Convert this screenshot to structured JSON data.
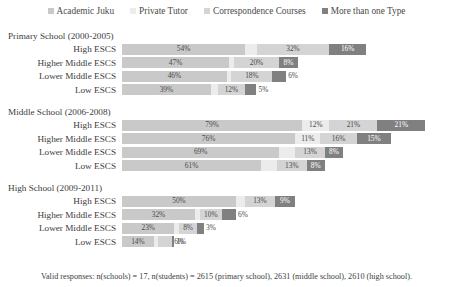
{
  "legend": {
    "items": [
      {
        "label": "Academic Juku",
        "color": "#c9c9c9",
        "icon": "square-marker-icon"
      },
      {
        "label": "Private Tutor",
        "color": "#ececec",
        "icon": "square-marker-icon"
      },
      {
        "label": "Correspondence Courses",
        "color": "#d4d4d4",
        "icon": "square-marker-icon"
      },
      {
        "label": "More than one Type",
        "color": "#808080",
        "icon": "square-marker-icon"
      }
    ]
  },
  "footnote": "Valid responses: n(schools) = 17, n(students) = 2615 (primary school), 2631 (middle school), 2610 (high school).",
  "chart_data": {
    "type": "bar",
    "orientation": "horizontal",
    "stacked": true,
    "title": "",
    "xlabel": "",
    "ylabel": "",
    "xlim": [
      0,
      100
    ],
    "grid": false,
    "legend_position": "top",
    "series": [
      {
        "name": "Academic Juku",
        "color": "#c9c9c9"
      },
      {
        "name": "Private Tutor",
        "color": "#ececec"
      },
      {
        "name": "Correspondence Courses",
        "color": "#d4d4d4"
      },
      {
        "name": "More than one Type",
        "color": "#808080"
      }
    ],
    "groups": [
      {
        "title": "Primary School (2000-2005)",
        "rows": [
          {
            "label": "High ESCS",
            "values": [
              54,
              5,
              32,
              16
            ],
            "labels": [
              "54%",
              "5%",
              "32%",
              "16%"
            ]
          },
          {
            "label": "Higher Middle ESCS",
            "values": [
              47,
              2,
              20,
              8
            ],
            "labels": [
              "47%",
              "2%",
              "20%",
              "8%"
            ]
          },
          {
            "label": "Lower Middle ESCS",
            "values": [
              46,
              2,
              18,
              6
            ],
            "labels": [
              "46%",
              "2%",
              "18%",
              "6%"
            ]
          },
          {
            "label": "Low ESCS",
            "values": [
              39,
              3,
              12,
              5
            ],
            "labels": [
              "39%",
              "3%",
              "12%",
              "5%"
            ]
          }
        ]
      },
      {
        "title": "Middle School (2006-2008)",
        "rows": [
          {
            "label": "High ESCS",
            "values": [
              79,
              12,
              21,
              21
            ],
            "labels": [
              "79%",
              "12%",
              "21%",
              "21%"
            ]
          },
          {
            "label": "Higher Middle ESCS",
            "values": [
              76,
              11,
              16,
              15
            ],
            "labels": [
              "76%",
              "11%",
              "16%",
              "15%"
            ]
          },
          {
            "label": "Lower Middle ESCS",
            "values": [
              69,
              7,
              13,
              8
            ],
            "labels": [
              "69%",
              "7%",
              "13%",
              "8%"
            ]
          },
          {
            "label": "Low ESCS",
            "values": [
              61,
              7,
              13,
              8
            ],
            "labels": [
              "61%",
              "7%",
              "13%",
              "8%"
            ]
          }
        ]
      },
      {
        "title": "High School (2009-2011)",
        "rows": [
          {
            "label": "High ESCS",
            "values": [
              50,
              4,
              13,
              9
            ],
            "labels": [
              "50%",
              "4%",
              "13%",
              "9%"
            ]
          },
          {
            "label": "Higher Middle ESCS",
            "values": [
              32,
              2,
              10,
              6
            ],
            "labels": [
              "32%",
              "2%",
              "10%",
              "6%"
            ]
          },
          {
            "label": "Lower Middle ESCS",
            "values": [
              23,
              2,
              8,
              3
            ],
            "labels": [
              "23%",
              "2%",
              "8%",
              "3%"
            ]
          },
          {
            "label": "Low ESCS",
            "values": [
              14,
              2,
              6,
              1
            ],
            "labels": [
              "14%",
              "2%",
              "6%",
              "1%"
            ]
          }
        ]
      }
    ]
  }
}
